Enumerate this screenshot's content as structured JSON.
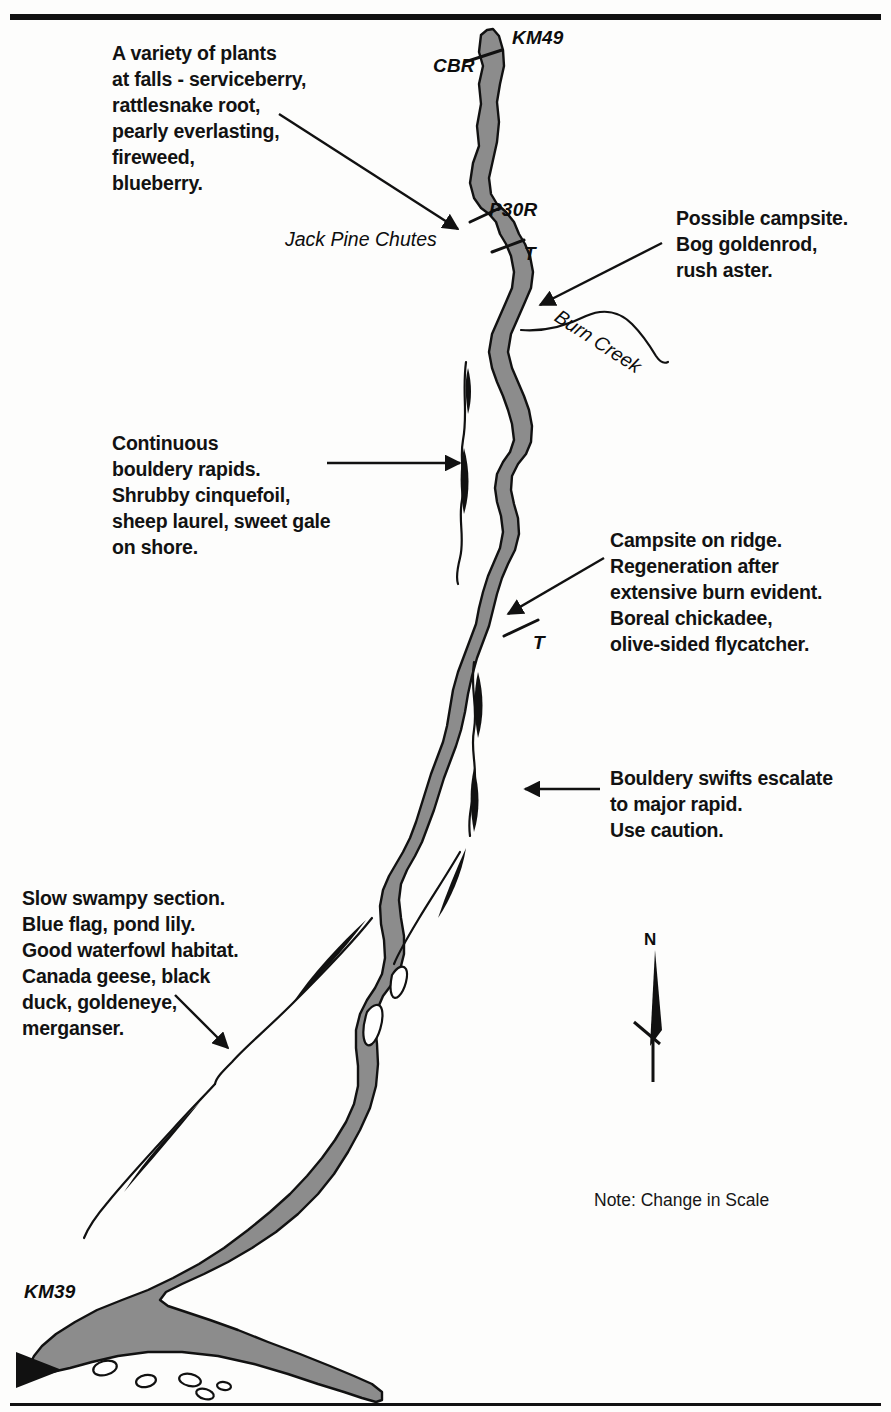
{
  "map": {
    "title_rule": "horizontal-rule",
    "river_color": "#8c8c8c",
    "river_outline_color": "#111111",
    "background_color": "#fdfdfc",
    "ink_color": "#121212"
  },
  "markers": {
    "km49": "KM49",
    "cbr": "CBR",
    "p30r": "P30R",
    "portage_t_upper": "T",
    "portage_t_lower": "T",
    "km39": "KM39"
  },
  "features": {
    "jack_pine_chutes": "Jack Pine Chutes",
    "burn_creek": "Burn Creek"
  },
  "notes": {
    "plants_at_falls": "A variety of plants\nat falls - serviceberry,\nrattlesnake root,\npearly everlasting,\nfireweed,\nblueberry.",
    "possible_campsite": "Possible campsite.\nBog goldenrod,\nrush aster.",
    "continuous_rapids": "Continuous\nbouldery rapids.\nShrubby cinquefoil,\nsheep laurel, sweet gale\non shore.",
    "campsite_on_ridge": "Campsite on ridge.\nRegeneration after\nextensive burn evident.\nBoreal chickadee,\nolive-sided flycatcher.",
    "bouldery_swifts": "Bouldery swifts escalate\nto major rapid.\nUse caution.",
    "slow_swampy": "Slow swampy section.\nBlue flag, pond lily.\nGood waterfowl habitat.\nCanada geese, black\nduck, goldeneye,\nmerganser."
  },
  "legend": {
    "north_letter": "N",
    "scale_note": "Note: Change in Scale",
    "north_arrow_icon": "north-arrow-icon",
    "flow_direction_icon": "flow-direction-arrow-icon"
  }
}
